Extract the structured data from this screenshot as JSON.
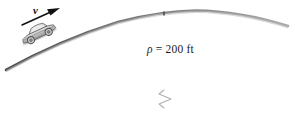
{
  "figure": {
    "velocity": {
      "label": "v",
      "arrow_name": "velocity-arrow"
    },
    "radius": {
      "symbol": "ρ",
      "equals": "=",
      "value": "200",
      "units": "ft",
      "full_label": "ρ = 200 ft"
    },
    "colors": {
      "road": "#6b6b6b",
      "road_fill": "#8f8f8f",
      "arrow": "#111111",
      "text": "#1a1a1a",
      "radius_line": "#9a9a9a",
      "car_body": "#b9b9b9",
      "car_outline": "#555555",
      "background": "#ffffff"
    }
  }
}
